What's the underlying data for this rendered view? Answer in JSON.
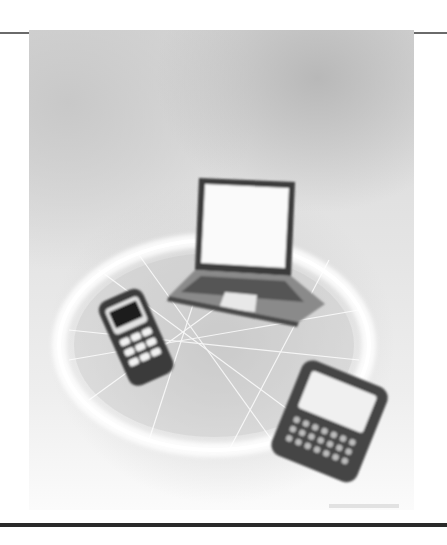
{
  "figure": {
    "devices": [
      {
        "name": "laptop",
        "icon": "laptop-icon"
      },
      {
        "name": "mobile-phone",
        "icon": "mobile-phone-icon"
      },
      {
        "name": "smartphone",
        "icon": "smartphone-icon"
      }
    ],
    "colors": {
      "background": "#ffffff",
      "rule_thin": "#6a6a6a",
      "rule_thick": "#2a2a2a",
      "photo_tone": "#d6d6d6"
    }
  }
}
